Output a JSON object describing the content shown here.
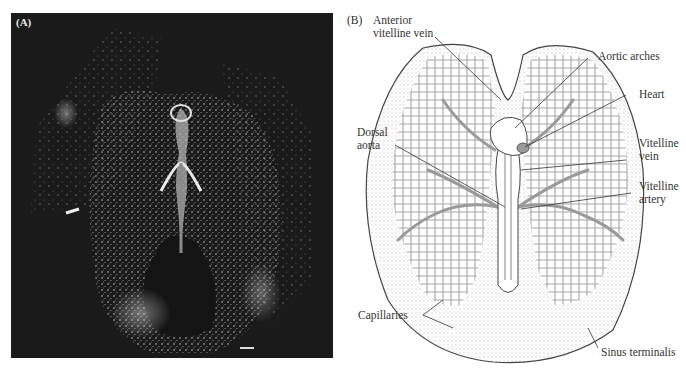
{
  "figure": {
    "panel_a": {
      "label": "(A)",
      "description": "Dark-field micrograph of chick embryo blastoderm showing vascular network",
      "background": "#1a1a1a"
    },
    "panel_b": {
      "label": "(B)",
      "description": "Line drawing of chick embryo with vitelline circulation",
      "labels": {
        "anterior_vitelline_vein": "Anterior\nvitelline vein",
        "anterior_vitelline_vein_l1": "Anterior",
        "anterior_vitelline_vein_l2": "vitelline vein",
        "aortic_arches": "Aortic arches",
        "heart": "Heart",
        "dorsal_aorta_l1": "Dorsal",
        "dorsal_aorta_l2": "aorta",
        "vitelline_vein_l1": "Vitelline",
        "vitelline_vein_l2": "vein",
        "vitelline_artery_l1": "Vitelline",
        "vitelline_artery_l2": "artery",
        "capillaries": "Capillaries",
        "sinus_terminalis": "Sinus terminalis"
      },
      "vessel_color": "#a0a0a0"
    }
  }
}
